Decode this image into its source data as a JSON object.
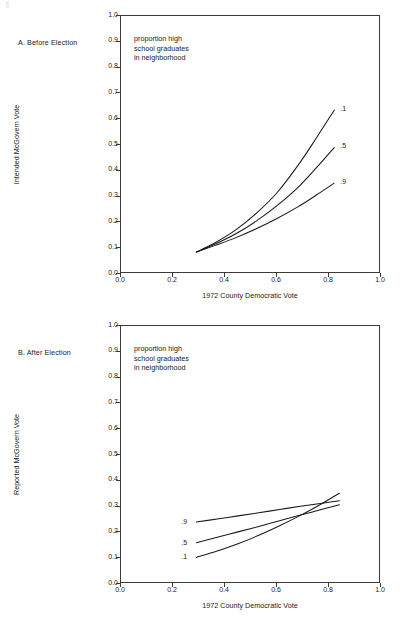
{
  "figure": {
    "panels": [
      {
        "id": "a",
        "label": "A.  Before Election",
        "annotation_lines": [
          "proportion high",
          "school graduates",
          "in neighborhood"
        ],
        "ylabel": "Intended McGovern Vote",
        "xlabel": "1972 County Democratic Vote",
        "label_side": "right"
      },
      {
        "id": "b",
        "label": "B.  After Election",
        "annotation_lines": [
          "proportion high",
          "school graduates",
          "in neighborhood"
        ],
        "ylabel": "Reported McGovern Vote",
        "xlabel": "1972 County Democratic Vote",
        "label_side": "left"
      }
    ],
    "axis_ticks": {
      "x": [
        "0.0",
        "0.2",
        "0.4",
        "0.6",
        "0.8",
        "1.0"
      ],
      "y": [
        "0.0",
        "0.1",
        "0.2",
        "0.3",
        "0.4",
        "0.5",
        "0.6",
        "0.7",
        "0.8",
        "0.9",
        "1.0"
      ]
    },
    "line_color": "#1a1a1a"
  },
  "chart_data": [
    {
      "type": "line",
      "title": "A.  Before Election",
      "xlabel": "1972 County Democratic Vote",
      "ylabel": "Intended McGovern Vote",
      "xlim": [
        0.0,
        1.0
      ],
      "ylim": [
        0.0,
        1.0
      ],
      "grid": false,
      "legend": "inline end-of-line labels at right",
      "annotation": "proportion high school graduates in neighborhood",
      "x": [
        0.29,
        0.36,
        0.44,
        0.52,
        0.6,
        0.68,
        0.75,
        0.82
      ],
      "series": [
        {
          "name": ".1",
          "label": ".1",
          "values": [
            0.085,
            0.12,
            0.17,
            0.235,
            0.315,
            0.42,
            0.525,
            0.635
          ]
        },
        {
          "name": ".5",
          "label": ".5",
          "values": [
            0.085,
            0.115,
            0.155,
            0.205,
            0.265,
            0.335,
            0.41,
            0.49
          ]
        },
        {
          "name": ".9",
          "label": ".9",
          "values": [
            0.085,
            0.11,
            0.14,
            0.175,
            0.215,
            0.26,
            0.305,
            0.352
          ]
        }
      ]
    },
    {
      "type": "line",
      "title": "B.  After Election",
      "xlabel": "1972 County Democratic Vote",
      "ylabel": "Reported McGovern Vote",
      "xlim": [
        0.0,
        1.0
      ],
      "ylim": [
        0.0,
        1.0
      ],
      "grid": false,
      "legend": "inline start-of-line labels at left",
      "annotation": "proportion high school graduates in neighborhood",
      "x": [
        0.29,
        0.37,
        0.45,
        0.53,
        0.61,
        0.69,
        0.76,
        0.84
      ],
      "series": [
        {
          "name": ".9",
          "label": ".9",
          "values": [
            0.24,
            0.252,
            0.264,
            0.276,
            0.289,
            0.301,
            0.311,
            0.323
          ]
        },
        {
          "name": ".5",
          "label": ".5",
          "values": [
            0.16,
            0.181,
            0.202,
            0.223,
            0.245,
            0.267,
            0.286,
            0.307
          ]
        },
        {
          "name": ".1",
          "label": ".1",
          "values": [
            0.103,
            0.128,
            0.156,
            0.189,
            0.226,
            0.266,
            0.304,
            0.352
          ]
        }
      ]
    }
  ]
}
